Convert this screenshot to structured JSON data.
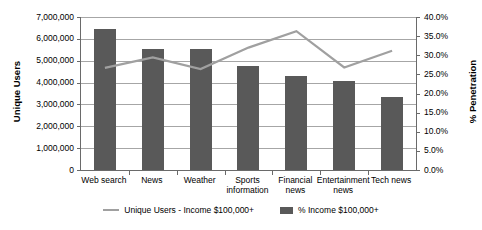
{
  "chart_data": {
    "type": "bar",
    "title": "",
    "xlabel": "",
    "ylabel": "Unique Users",
    "y2label": "% Penetration",
    "categories": [
      "Web search",
      "News",
      "Weather",
      "Sports information",
      "Financial news",
      "Entertainment news",
      "Tech news"
    ],
    "left_axis": {
      "ticks": [
        "0",
        "1,000,000",
        "2,000,000",
        "3,000,000",
        "4,000,000",
        "5,000,000",
        "6,000,000",
        "7,000,000"
      ],
      "values": [
        0,
        1000000,
        2000000,
        3000000,
        4000000,
        5000000,
        6000000,
        7000000
      ],
      "ylim": [
        0,
        7000000
      ]
    },
    "right_axis": {
      "ticks": [
        "0.0%",
        "5.0%",
        "10.0%",
        "15.0%",
        "20.0%",
        "25.0%",
        "30.0%",
        "35.0%",
        "40.0%"
      ],
      "values": [
        0,
        5,
        10,
        15,
        20,
        25,
        30,
        35,
        40
      ],
      "ylim": [
        0,
        40
      ]
    },
    "grid": true,
    "legend_position": "bottom",
    "series": [
      {
        "name": "% Income $100,000+",
        "type": "bar",
        "axis": "left",
        "color": "#595959",
        "values": [
          6430000,
          5520000,
          5540000,
          4740000,
          4290000,
          4070000,
          3350000
        ]
      },
      {
        "name": "Unique Users - Income $100,000+",
        "type": "line",
        "axis": "right",
        "color": "#a0a0a0",
        "values": [
          26.7,
          29.4,
          26.4,
          32.0,
          36.3,
          26.8,
          31.2
        ]
      }
    ]
  },
  "legend": {
    "items": [
      {
        "label": "Unique Users - Income $100,000+",
        "marker": "line"
      },
      {
        "label": "% Income $100,000+",
        "marker": "bar"
      }
    ]
  }
}
